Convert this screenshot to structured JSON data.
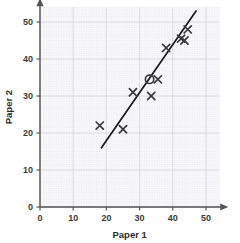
{
  "chart_data": {
    "type": "scatter",
    "title": "",
    "xlabel": "Paper 1",
    "ylabel": "Paper 2",
    "xlim": [
      0,
      54
    ],
    "ylim": [
      0,
      54
    ],
    "xticks": [
      0,
      10,
      20,
      30,
      40,
      50
    ],
    "yticks": [
      0,
      10,
      20,
      30,
      40,
      50
    ],
    "xtick_labels": [
      "0",
      "10",
      "20",
      "30",
      "40",
      "50"
    ],
    "ytick_labels": [
      "0",
      "10",
      "20",
      "30",
      "40",
      "50"
    ],
    "grid": true,
    "grid_major_step": 10,
    "grid_minor_step": 0.5,
    "legend": "none",
    "marker": "x",
    "points": [
      {
        "x": 18.0,
        "y": 22.0,
        "marker": "x"
      },
      {
        "x": 25.0,
        "y": 21.0,
        "marker": "x"
      },
      {
        "x": 28.0,
        "y": 31.0,
        "marker": "x"
      },
      {
        "x": 33.5,
        "y": 30.0,
        "marker": "x"
      },
      {
        "x": 33.0,
        "y": 34.5,
        "marker": "circle"
      },
      {
        "x": 35.5,
        "y": 34.5,
        "marker": "x"
      },
      {
        "x": 38.0,
        "y": 43.0,
        "marker": "x"
      },
      {
        "x": 42.5,
        "y": 45.5,
        "marker": "x"
      },
      {
        "x": 43.5,
        "y": 45.0,
        "marker": "x"
      },
      {
        "x": 44.5,
        "y": 48.0,
        "marker": "x"
      }
    ],
    "trend_line": {
      "label": "line of best fit",
      "x_start": 18.5,
      "y_start": 16.0,
      "x_end": 47.0,
      "y_end": 53.0
    },
    "highlight": {
      "label": "mean point",
      "x": 33.0,
      "y": 34.5,
      "marker": "circle"
    },
    "colors": {
      "axis": "#555555",
      "grid_major": "#d8d8dd",
      "grid_minor": "#eeeef2",
      "marker": "#3a3a3a",
      "line": "#1a1a1a",
      "text": "#2b2b2b",
      "background": "#ffffff"
    }
  }
}
